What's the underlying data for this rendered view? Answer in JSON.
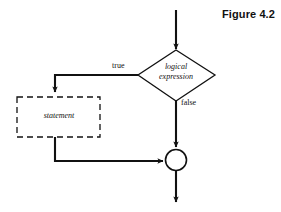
{
  "figure": {
    "title": "Figure 4.2"
  },
  "diagram": {
    "type": "flowchart",
    "nodes": {
      "decision": {
        "shape": "diamond",
        "line1": "logical",
        "line2": "expression",
        "text": "logical expression"
      },
      "statement": {
        "shape": "dashed-rectangle",
        "text": "statement"
      },
      "merge": {
        "shape": "circle",
        "text": ""
      }
    },
    "edges": {
      "true_label": "true",
      "false_label": "false"
    },
    "colors": {
      "stroke": "#111111",
      "background": "#ffffff",
      "text": "#111111"
    }
  }
}
